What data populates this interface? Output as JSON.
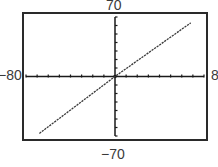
{
  "chart_data": {
    "type": "line",
    "title": "",
    "xlabel": "",
    "ylabel": "",
    "xlim": [
      -80,
      80
    ],
    "ylim": [
      -70,
      70
    ],
    "xscale_ticks": 10,
    "yscale_ticks": 10,
    "grid": false,
    "window_labels": {
      "ymax": "70",
      "ymin": "-70",
      "xmin": "-80",
      "xmax": "80"
    },
    "series": [
      {
        "name": "y = x",
        "x": [
          -68,
          0,
          68
        ],
        "y": [
          -67,
          0,
          63
        ]
      }
    ]
  },
  "labels": {
    "top": "70",
    "bottom": "−70",
    "left": "−80",
    "right": "8"
  },
  "colors": {
    "frame": "#2a2a2a",
    "axes": "#1a1a1a",
    "line": "#3a3a3a"
  }
}
